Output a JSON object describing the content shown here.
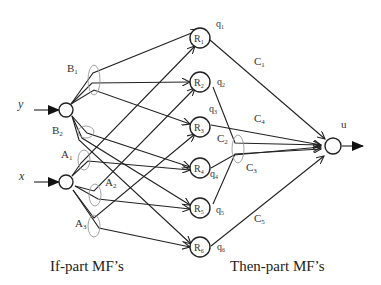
{
  "diagram": {
    "type": "neuro-fuzzy network",
    "inputs": [
      {
        "id": "y",
        "label": "y"
      },
      {
        "id": "x",
        "label": "x"
      }
    ],
    "if_part_mfs": {
      "y": [
        "B1",
        "B2"
      ],
      "x": [
        "A1",
        "A2",
        "A3"
      ]
    },
    "mf_labels": {
      "B1": {
        "base": "B",
        "sub": "1"
      },
      "B2": {
        "base": "B",
        "sub": "2"
      },
      "A1": {
        "base": "A",
        "sub": "1"
      },
      "A2": {
        "base": "A",
        "sub": "2"
      },
      "A3": {
        "base": "A",
        "sub": "3"
      }
    },
    "rules": [
      {
        "base": "R",
        "sub": "1",
        "q_base": "q",
        "q_sub": "1"
      },
      {
        "base": "R",
        "sub": "2",
        "q_base": "q",
        "q_sub": "2"
      },
      {
        "base": "R",
        "sub": "3",
        "q_base": "q",
        "q_sub": "3"
      },
      {
        "base": "R",
        "sub": "4",
        "q_base": "q",
        "q_sub": "4"
      },
      {
        "base": "R",
        "sub": "5",
        "q_base": "q",
        "q_sub": "5"
      },
      {
        "base": "R",
        "sub": "6",
        "q_base": "q",
        "q_sub": "6"
      }
    ],
    "then_part_mfs": [
      {
        "base": "C",
        "sub": "1"
      },
      {
        "base": "C",
        "sub": "2"
      },
      {
        "base": "C",
        "sub": "3"
      },
      {
        "base": "C",
        "sub": "4"
      },
      {
        "base": "C",
        "sub": "5"
      }
    ],
    "output": {
      "label": "u"
    },
    "captions": {
      "left": "If-part MF’s",
      "right": "Then-part MF’s"
    }
  }
}
